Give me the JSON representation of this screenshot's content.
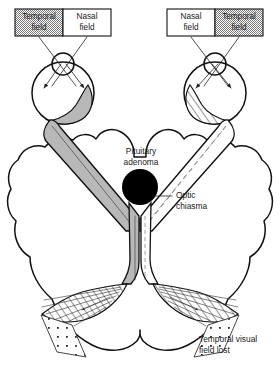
{
  "figure": {
    "background_color": "#ffffff",
    "ink_color": "#111111",
    "tract_fill_color": "#b8b8b8",
    "tumor_color": "#000000",
    "shaded_field_color": "#9a9a9a"
  },
  "visual_fields": {
    "left_eye_box": {
      "name": "left-visual-field-box",
      "segments": [
        {
          "label_line1": "Temporal",
          "label_line2": "field",
          "shaded": true
        },
        {
          "label_line1": "Nasal",
          "label_line2": "field",
          "shaded": false
        }
      ]
    },
    "right_eye_box": {
      "name": "right-visual-field-box",
      "segments": [
        {
          "label_line1": "Nasal",
          "label_line2": "field",
          "shaded": false
        },
        {
          "label_line1": "Temporal",
          "label_line2": "field",
          "shaded": true
        }
      ]
    }
  },
  "annotations": {
    "pituitary_adenoma": {
      "line1": "Pituitary",
      "line2": "adenoma"
    },
    "optic_chiasma": {
      "line1": "Optic",
      "line2": "chiasma"
    },
    "field_lost": {
      "line1": "Temporal visual",
      "line2": "field lost"
    }
  },
  "structures": [
    {
      "name": "left-eyeball",
      "description": "left globe with lens"
    },
    {
      "name": "right-eyeball",
      "description": "right globe with lens"
    },
    {
      "name": "left-optic-nerve",
      "description": "shaded left optic nerve"
    },
    {
      "name": "right-optic-nerve",
      "description": "hatched right optic nerve"
    },
    {
      "name": "optic-chiasma",
      "description": "crossing point of optic nerves"
    },
    {
      "name": "pituitary-adenoma",
      "description": "black tumour mass at chiasma"
    },
    {
      "name": "left-optic-radiation",
      "description": "fanning fibres to left occipital lobe"
    },
    {
      "name": "right-optic-radiation",
      "description": "fanning fibres to right occipital lobe"
    },
    {
      "name": "left-occipital-lobe",
      "description": "left cerebral hemisphere"
    },
    {
      "name": "right-occipital-lobe",
      "description": "right cerebral hemisphere"
    },
    {
      "name": "left-field-loss-area",
      "description": "stippled lost-field wedge, left"
    },
    {
      "name": "right-field-loss-area",
      "description": "stippled lost-field wedge, right"
    }
  ]
}
